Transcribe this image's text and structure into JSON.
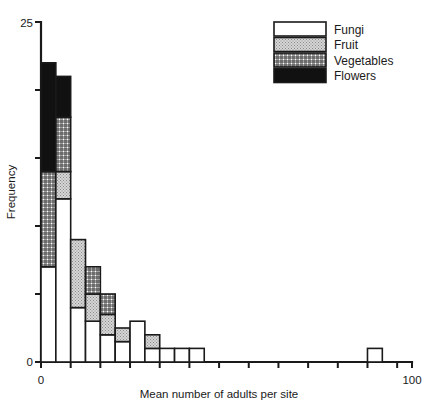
{
  "chart_data": {
    "type": "bar",
    "title": "",
    "subtitle": "",
    "xlabel": "Mean number of adults per site",
    "ylabel": "Frequency",
    "xlim": [
      0,
      100
    ],
    "ylim": [
      0,
      25
    ],
    "grid": false,
    "stacked": true,
    "bar_width_units": 4,
    "legend_position": "top-right",
    "x_ticks": [
      0,
      100
    ],
    "x_tick_labels": [
      "0",
      "100"
    ],
    "x_minor_ticks": [
      0,
      8,
      16,
      24,
      32,
      40,
      48,
      56,
      64,
      72,
      80,
      88,
      96
    ],
    "y_ticks": [
      0,
      5,
      10,
      15,
      20,
      25
    ],
    "y_tick_labels": [
      "0",
      "",
      "",
      "",
      "",
      "25"
    ],
    "categories": [
      "0-4",
      "4-8",
      "8-12",
      "12-16",
      "16-20",
      "20-24",
      "24-28",
      "28-32",
      "32-36",
      "36-40",
      "40-44",
      "88-92"
    ],
    "bin_starts": [
      0,
      4,
      8,
      12,
      16,
      20,
      24,
      28,
      32,
      36,
      40,
      88
    ],
    "series": [
      {
        "name": "Fungi",
        "fill": "white",
        "color": "#ffffff",
        "values": [
          7,
          12,
          4,
          3,
          2,
          1.5,
          3,
          1,
          1,
          1,
          1,
          1
        ]
      },
      {
        "name": "Fruit",
        "fill": "stipple",
        "color": "#cfcfcf",
        "values": [
          0,
          2,
          5,
          2,
          1.5,
          1,
          0,
          1,
          0,
          0,
          0,
          0
        ]
      },
      {
        "name": "Vegetables",
        "fill": "crosshatch",
        "color": "#e8e8e8",
        "values": [
          7,
          4,
          0,
          2,
          1.5,
          0,
          0,
          0,
          0,
          0,
          0,
          0
        ]
      },
      {
        "name": "Flowers",
        "fill": "solid-black",
        "color": "#111111",
        "values": [
          8,
          3,
          0,
          0,
          0,
          0,
          0,
          0,
          0,
          0,
          0,
          0
        ]
      }
    ],
    "totals": [
      22,
      21,
      9,
      7,
      5,
      2.5,
      3,
      2,
      1,
      1,
      1,
      1
    ]
  },
  "legend": {
    "items": [
      {
        "label": "Fungi"
      },
      {
        "label": "Fruit"
      },
      {
        "label": "Vegetables"
      },
      {
        "label": "Flowers"
      }
    ]
  },
  "axes": {
    "y_label": "Frequency",
    "y_max_label": "25",
    "y_min_label": "0",
    "x_label": "Mean number of adults per site",
    "x_min_label": "0",
    "x_max_label": "100"
  }
}
